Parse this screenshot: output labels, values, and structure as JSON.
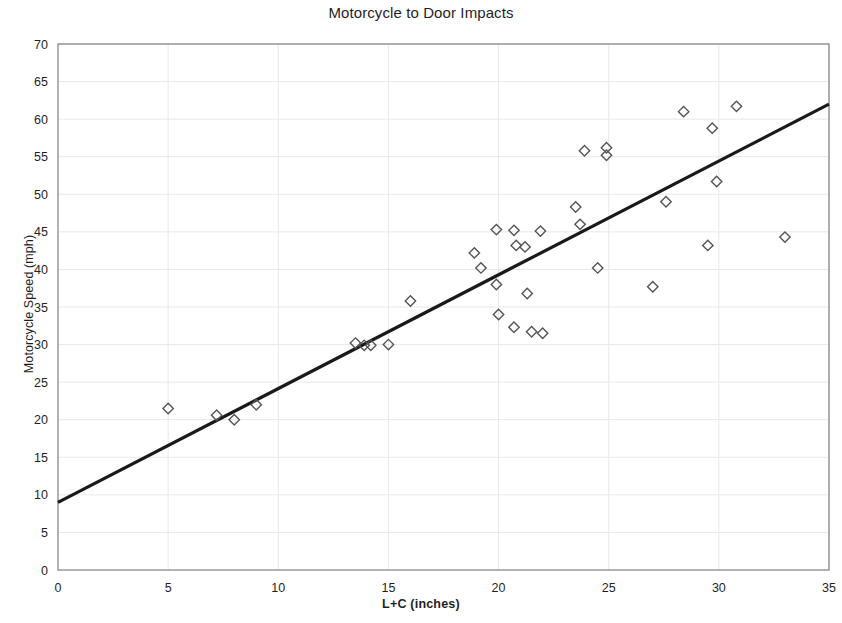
{
  "chart_data": {
    "type": "scatter",
    "title": "Motorcycle to Door Impacts",
    "xlabel": "L+C (inches)",
    "ylabel": "Motorcycle Speed (mph)",
    "xlim": [
      0,
      35
    ],
    "ylim": [
      0,
      70
    ],
    "xticks": [
      0,
      5,
      10,
      15,
      20,
      25,
      30,
      35
    ],
    "yticks": [
      0,
      5,
      10,
      15,
      20,
      25,
      30,
      35,
      40,
      45,
      50,
      55,
      60,
      65,
      70
    ],
    "grid": true,
    "legend": "none",
    "marker": "open-diamond",
    "series": [
      {
        "name": "Motorcycle to Door Impacts",
        "points": [
          [
            5.0,
            21.5
          ],
          [
            7.2,
            20.6
          ],
          [
            8.0,
            20.0
          ],
          [
            9.0,
            22.0
          ],
          [
            13.5,
            30.2
          ],
          [
            13.9,
            29.9
          ],
          [
            14.2,
            29.9
          ],
          [
            15.0,
            30.0
          ],
          [
            16.0,
            35.8
          ],
          [
            18.9,
            42.2
          ],
          [
            19.2,
            40.2
          ],
          [
            19.9,
            45.3
          ],
          [
            19.9,
            38.0
          ],
          [
            20.0,
            34.0
          ],
          [
            20.7,
            45.2
          ],
          [
            20.8,
            43.2
          ],
          [
            20.7,
            32.3
          ],
          [
            21.2,
            43.0
          ],
          [
            21.3,
            36.8
          ],
          [
            21.5,
            31.7
          ],
          [
            21.9,
            45.1
          ],
          [
            22.0,
            31.5
          ],
          [
            23.5,
            48.3
          ],
          [
            23.7,
            46.0
          ],
          [
            23.9,
            55.8
          ],
          [
            24.5,
            40.2
          ],
          [
            24.9,
            56.2
          ],
          [
            24.9,
            55.2
          ],
          [
            27.0,
            37.7
          ],
          [
            27.6,
            49.0
          ],
          [
            28.4,
            61.0
          ],
          [
            29.5,
            43.2
          ],
          [
            29.7,
            58.8
          ],
          [
            29.9,
            51.7
          ],
          [
            30.8,
            61.7
          ],
          [
            33.0,
            44.3
          ]
        ]
      }
    ],
    "trendline": {
      "name": "linear-fit",
      "x_start": 0,
      "y_start": 9.0,
      "x_end": 35,
      "y_end": 62.0
    },
    "colors": {
      "marker_stroke": "#555555",
      "trendline": "#1a1a1a",
      "axis": "#808080",
      "grid": "#e8e8e8",
      "text": "#1f1f1f"
    }
  }
}
